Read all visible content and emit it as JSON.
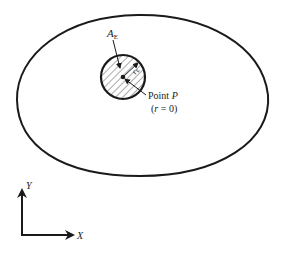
{
  "diagram": {
    "labels": {
      "area": "A",
      "area_sub": "E",
      "radius": "r",
      "radius_sub": "E",
      "point_prefix": "Point ",
      "point_name": "P",
      "point_condition_open": "(",
      "point_condition_var": "r",
      "point_condition_rest": " = 0)",
      "axis_y": "Y",
      "axis_x": "X"
    },
    "colors": {
      "stroke": "#1a1a1a",
      "hatch": "#555555",
      "background": "#ffffff"
    }
  }
}
